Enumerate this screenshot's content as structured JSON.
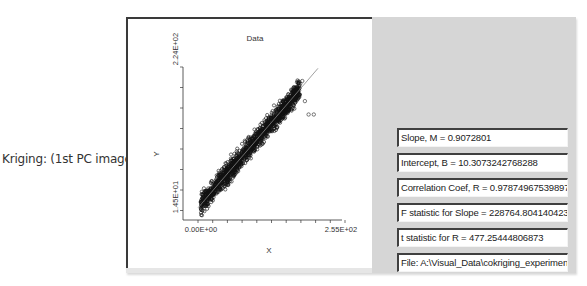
{
  "caption": "Kriging: (1st PC image)",
  "chart_data": {
    "type": "scatter",
    "title": "Data",
    "xlabel": "X",
    "ylabel": "Y",
    "x_tick_labels": [
      "0.00E+00",
      "2.55E+02"
    ],
    "y_tick_labels": [
      "1.45E+01",
      "2.24E+02"
    ],
    "xlim": [
      0,
      255
    ],
    "ylim": [
      14.5,
      224
    ],
    "regression_line": {
      "slope": 0.9072801,
      "intercept": 10.3073242768288
    },
    "marker": "open-circle",
    "outliers_approx": [
      [
        212,
        150
      ],
      [
        222,
        150
      ],
      [
        205,
        170
      ],
      [
        196,
        196
      ],
      [
        200,
        200
      ]
    ]
  },
  "stats": {
    "slope": "Slope, M = 0.9072801",
    "intercept": "Intercept, B = 10.3073242768288",
    "correlation": "Correlation Coef, R = 0.978749675398978",
    "f_stat": "F statistic for Slope = 228764.804140423",
    "t_stat": "t statistic for R = 477.25444806873",
    "file": "File: A:\\Visual_Data\\cokriging_experiments\\N"
  }
}
